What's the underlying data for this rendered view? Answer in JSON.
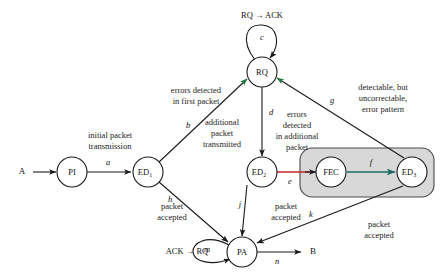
{
  "diagram": {
    "nodes": [
      {
        "id": "A",
        "label": "A",
        "sub": "",
        "type": "terminal",
        "x": 22,
        "y": 172
      },
      {
        "id": "PI",
        "label": "PI",
        "sub": "",
        "type": "state",
        "x": 72,
        "y": 172
      },
      {
        "id": "ED1",
        "label": "ED",
        "sub": "1",
        "type": "state",
        "x": 148,
        "y": 172
      },
      {
        "id": "RQ",
        "label": "RQ",
        "sub": "",
        "type": "state",
        "x": 262,
        "y": 72
      },
      {
        "id": "ED2",
        "label": "ED",
        "sub": "2",
        "type": "state",
        "x": 262,
        "y": 172
      },
      {
        "id": "FEC",
        "label": "FEC",
        "sub": "",
        "type": "state",
        "x": 331,
        "y": 172
      },
      {
        "id": "ED3",
        "label": "ED",
        "sub": "3",
        "type": "state",
        "x": 412,
        "y": 172
      },
      {
        "id": "PA",
        "label": "PA",
        "sub": "",
        "type": "state",
        "x": 242,
        "y": 252
      },
      {
        "id": "B",
        "label": "B",
        "sub": "",
        "type": "terminal",
        "x": 313,
        "y": 252
      }
    ],
    "edges": [
      {
        "id": "start",
        "letter": "",
        "from": "A",
        "to": "PI",
        "color": "#1a1a1a"
      },
      {
        "id": "a",
        "letter": "a",
        "from": "PI",
        "to": "ED1",
        "color": "#1a1a1a"
      },
      {
        "id": "b",
        "letter": "b",
        "from": "ED1",
        "to": "RQ",
        "color": "#1a1a1a"
      },
      {
        "id": "c",
        "letter": "c",
        "from": "RQ",
        "to": "RQ",
        "color": "#1a1a1a"
      },
      {
        "id": "d",
        "letter": "d",
        "from": "RQ",
        "to": "ED2",
        "color": "#1a1a1a"
      },
      {
        "id": "e",
        "letter": "e",
        "from": "ED2",
        "to": "FEC",
        "color": "#c0272d"
      },
      {
        "id": "f",
        "letter": "f",
        "from": "FEC",
        "to": "ED3",
        "color": "#1b6b63"
      },
      {
        "id": "g",
        "letter": "g",
        "from": "ED3",
        "to": "RQ",
        "color": "#1a1a1a"
      },
      {
        "id": "h",
        "letter": "h",
        "from": "ED1",
        "to": "PA",
        "color": "#1a1a1a"
      },
      {
        "id": "j",
        "letter": "j",
        "from": "ED2",
        "to": "PA",
        "color": "#1a1a1a"
      },
      {
        "id": "k",
        "letter": "k",
        "from": "ED3",
        "to": "PA",
        "color": "#1a1a1a"
      },
      {
        "id": "m",
        "letter": "m",
        "from": "PA",
        "to": "PA",
        "color": "#1a1a1a"
      },
      {
        "id": "n",
        "letter": "n",
        "from": "PA",
        "to": "B",
        "color": "#1a1a1a"
      }
    ],
    "annotations": [
      {
        "id": "ann-rq-ack",
        "lines": [
          "RQ → ACK"
        ],
        "x": 262,
        "y": 16,
        "style": "plain"
      },
      {
        "id": "ann-ack-rq",
        "lines": [
          "ACK → RQ"
        ],
        "x": 187,
        "y": 252,
        "style": "plain"
      },
      {
        "id": "ann-initial-packet",
        "lines": [
          "initial packet",
          "transmission"
        ],
        "x": 110,
        "y": 141,
        "style": "plain"
      },
      {
        "id": "ann-errors-first",
        "lines": [
          "errors detected",
          "in first packet"
        ],
        "x": 196,
        "y": 96,
        "style": "plain"
      },
      {
        "id": "ann-additional-tx",
        "lines": [
          "additional",
          "packet",
          "transmitted"
        ],
        "x": 222,
        "y": 134,
        "style": "plain"
      },
      {
        "id": "ann-errors-addl",
        "lines": [
          "errors",
          "detected",
          "in additional",
          "packet"
        ],
        "x": 295,
        "y": 131,
        "style": "plain"
      },
      {
        "id": "ann-detectable",
        "lines": [
          "detectable, but",
          "uncorrectable,",
          "error pattern"
        ],
        "x": 383,
        "y": 97,
        "style": "plain"
      },
      {
        "id": "ann-packet-acc-left",
        "lines": [
          "packet",
          "accepted"
        ],
        "x": 172,
        "y": 212,
        "style": "plain"
      },
      {
        "id": "ann-packet-acc-mid",
        "lines": [
          "packet",
          "accepted"
        ],
        "x": 285,
        "y": 212,
        "style": "plain"
      },
      {
        "id": "ann-packet-acc-right",
        "lines": [
          "packet",
          "accepted"
        ],
        "x": 378,
        "y": 230,
        "style": "plain"
      }
    ],
    "groups": [
      {
        "id": "fec-group",
        "label": "",
        "x": 300,
        "y": 148,
        "width": 134,
        "height": 49
      }
    ],
    "colors": {
      "node_stroke": "#1a1a1a",
      "node_fill": "#ffffff",
      "edge_default": "#1a1a1a",
      "edge_error": "#c0272d",
      "edge_correct": "#1b6b63",
      "arrow_accent": "#1b7a3e",
      "group_fill": "#d8d8d8",
      "annotation_text": "#1c1c1c",
      "background": "#ffffff"
    }
  }
}
